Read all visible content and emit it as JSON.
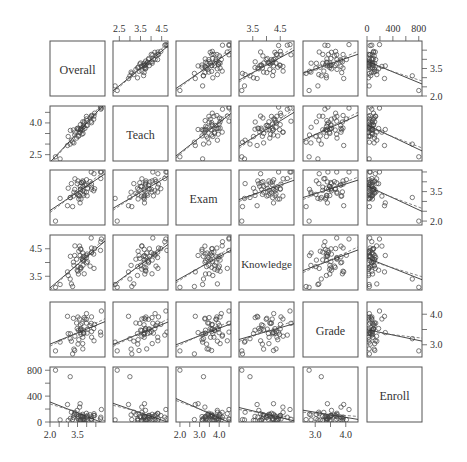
{
  "chart_data": {
    "type": "scatter",
    "subtype": "scatterplot_matrix",
    "variables": [
      "Overall",
      "Teach",
      "Exam",
      "Knowledge",
      "Grade",
      "Enroll"
    ],
    "panel_lines": [
      "solid: linear fit",
      "dashed: robust/lowess fit"
    ],
    "axes": {
      "Overall": {
        "range": [
          2.0,
          5.0
        ],
        "ticks": [
          2.0,
          2.5,
          3.0,
          3.5,
          4.0,
          4.5
        ],
        "tick_labels": [
          "2.0",
          "3.5"
        ],
        "label_side": "bottom"
      },
      "Teach": {
        "range": [
          2.2,
          4.8
        ],
        "ticks": [
          2.5,
          3.0,
          3.5,
          4.0,
          4.5
        ],
        "tick_labels": [
          "2.5",
          "3.5",
          "4.5"
        ],
        "label_side": "top",
        "tick_labels_left": [
          "2.5",
          "4.0"
        ]
      },
      "Exam": {
        "range": [
          1.8,
          4.6
        ],
        "ticks": [
          2.0,
          2.5,
          3.0,
          3.5,
          4.0,
          4.5
        ],
        "tick_labels": [
          "2.0",
          "3.0",
          "4.0"
        ],
        "label_side": "bottom",
        "tick_labels_right": [
          "2.0",
          "3.5"
        ]
      },
      "Knowledge": {
        "range": [
          3.0,
          5.0
        ],
        "ticks": [
          3.5,
          4.0,
          4.5
        ],
        "tick_labels": [
          "3.5",
          "4.5"
        ],
        "label_side": "top",
        "tick_labels_left": [
          "3.5",
          "4.5"
        ]
      },
      "Grade": {
        "range": [
          2.6,
          4.4
        ],
        "ticks": [
          3.0,
          3.5,
          4.0
        ],
        "tick_labels": [
          "3.0",
          "4.0"
        ],
        "label_side": "bottom",
        "tick_labels_right": [
          "3.0",
          "4.0"
        ]
      },
      "Enroll": {
        "range": [
          0,
          850
        ],
        "ticks": [
          0,
          200,
          400,
          600,
          800
        ],
        "tick_labels": [
          "0",
          "400",
          "800"
        ],
        "label_side": "top",
        "tick_labels_left": [
          "0",
          "400",
          "800"
        ]
      }
    },
    "n_points": 50,
    "title": "",
    "grid": false,
    "legend": null
  },
  "labels": {
    "diag": [
      "Overall",
      "Teach",
      "Exam",
      "Knowledge",
      "Grade",
      "Enroll"
    ],
    "top_axis": [
      {
        "col": 1,
        "values": [
          "2.5",
          "3.5",
          "4.5"
        ]
      },
      {
        "col": 3,
        "values": [
          "3.5",
          "4.5"
        ]
      },
      {
        "col": 5,
        "values": [
          "0",
          "400",
          "800"
        ]
      }
    ],
    "bottom_axis": [
      {
        "col": 0,
        "values": [
          "2.0",
          "3.5"
        ]
      },
      {
        "col": 2,
        "values": [
          "2.0",
          "3.0",
          "4.0"
        ]
      },
      {
        "col": 4,
        "values": [
          "3.0",
          "4.0"
        ]
      }
    ],
    "left_axis": [
      {
        "row": 1,
        "values": [
          "4.0",
          "2.5"
        ]
      },
      {
        "row": 3,
        "values": [
          "4.5",
          "3.5"
        ]
      },
      {
        "row": 5,
        "values": [
          "800",
          "400",
          "0"
        ]
      }
    ],
    "right_axis": [
      {
        "row": 0,
        "values": [
          "3.5",
          "2.0"
        ]
      },
      {
        "row": 2,
        "values": [
          "3.5",
          "2.0"
        ]
      },
      {
        "row": 4,
        "values": [
          "4.0",
          "3.0"
        ]
      }
    ]
  }
}
